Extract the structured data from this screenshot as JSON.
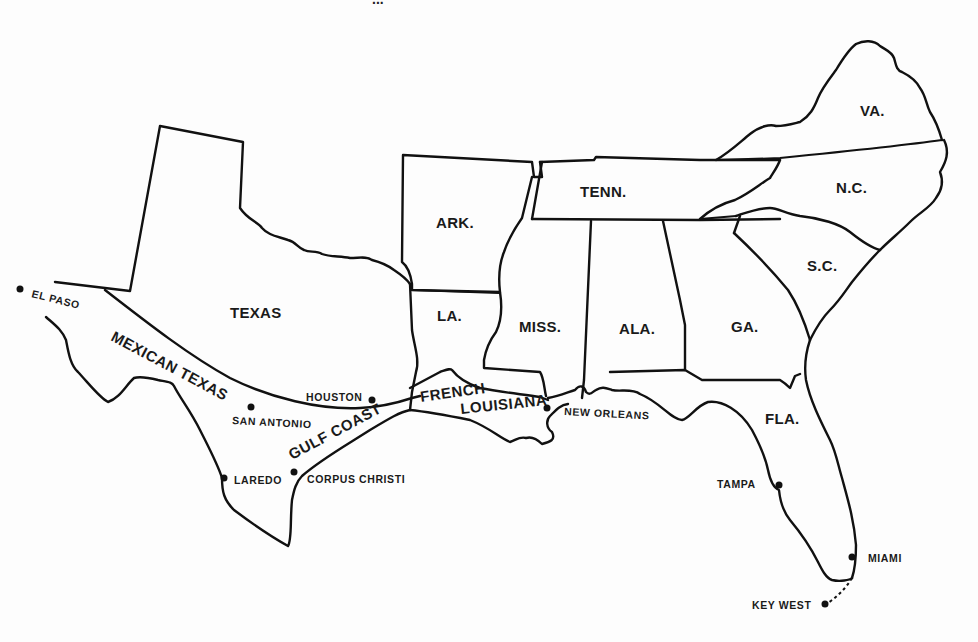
{
  "map": {
    "title_fragment": "...",
    "background": "#fdfdfd",
    "ink_color": "#111111",
    "states": [
      {
        "id": "texas",
        "label": "TEXAS",
        "x": 230,
        "y": 318
      },
      {
        "id": "arkansas",
        "label": "ARK.",
        "x": 436,
        "y": 228
      },
      {
        "id": "louisiana",
        "label": "LA.",
        "x": 437,
        "y": 321
      },
      {
        "id": "mississippi",
        "label": "MISS.",
        "x": 519,
        "y": 332
      },
      {
        "id": "alabama",
        "label": "ALA.",
        "x": 619,
        "y": 334
      },
      {
        "id": "georgia",
        "label": "GA.",
        "x": 731,
        "y": 332
      },
      {
        "id": "tennessee",
        "label": "TENN.",
        "x": 580,
        "y": 197
      },
      {
        "id": "virginia",
        "label": "VA.",
        "x": 860,
        "y": 116
      },
      {
        "id": "north_carolina",
        "label": "N.C.",
        "x": 836,
        "y": 193
      },
      {
        "id": "south_carolina",
        "label": "S.C.",
        "x": 807,
        "y": 271
      },
      {
        "id": "florida",
        "label": "FLA.",
        "x": 765,
        "y": 424
      }
    ],
    "regions": [
      {
        "id": "mexican_texas",
        "label": "MEXICAN TEXAS",
        "x": 110,
        "y": 340,
        "rotate": 28
      },
      {
        "id": "gulf_coast",
        "label": "GULF COAST",
        "x": 292,
        "y": 460,
        "rotate": -28
      },
      {
        "id": "french_louisiana_1",
        "label": "FRENCH",
        "x": 421,
        "y": 402,
        "rotate": -8
      },
      {
        "id": "french_louisiana_2",
        "label": "LOUISIANA",
        "x": 461,
        "y": 414,
        "rotate": -6
      }
    ],
    "cities": [
      {
        "id": "el_paso",
        "label": "EL PASO",
        "dot_x": 20,
        "dot_y": 289,
        "label_x": 31,
        "label_y": 297,
        "rotate": 14
      },
      {
        "id": "houston",
        "label": "HOUSTON",
        "dot_x": 372,
        "dot_y": 400,
        "label_x": 306,
        "label_y": 401,
        "rotate": 0
      },
      {
        "id": "san_antonio",
        "label": "SAN ANTONIO",
        "dot_x": 251,
        "dot_y": 407,
        "label_x": 232,
        "label_y": 424,
        "rotate": 3
      },
      {
        "id": "laredo",
        "label": "LAREDO",
        "dot_x": 224,
        "dot_y": 478,
        "label_x": 234,
        "label_y": 484,
        "rotate": 0
      },
      {
        "id": "corpus_christi",
        "label": "CORPUS CHRISTI",
        "dot_x": 294,
        "dot_y": 472,
        "label_x": 307,
        "label_y": 483,
        "rotate": 0
      },
      {
        "id": "new_orleans",
        "label": "NEW ORLEANS",
        "dot_x": 547,
        "dot_y": 408,
        "label_x": 564,
        "label_y": 415,
        "rotate": 3
      },
      {
        "id": "tampa",
        "label": "TAMPA",
        "dot_x": 779,
        "dot_y": 485,
        "label_x": 717,
        "label_y": 488,
        "rotate": 0
      },
      {
        "id": "miami",
        "label": "MIAMI",
        "dot_x": 852,
        "dot_y": 557,
        "label_x": 868,
        "label_y": 562,
        "rotate": 0
      },
      {
        "id": "key_west",
        "label": "KEY WEST",
        "dot_x": 825,
        "dot_y": 604,
        "label_x": 752,
        "label_y": 609,
        "rotate": 0
      }
    ]
  }
}
